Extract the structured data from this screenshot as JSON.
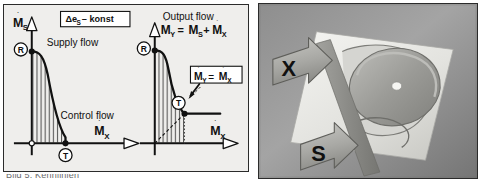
{
  "figure": {
    "background_color": "#ffffff",
    "panel_background": "#efeeec",
    "border_color": "#2b2b2b",
    "curve_color": "#111111",
    "hatch_color": "#333333"
  },
  "caption": {
    "text": "Bild 5. Kennlinien"
  },
  "diagram": {
    "condition_box": {
      "label": "Δe",
      "subscript": "S",
      "suffix": "– konst"
    },
    "left_chart": {
      "y_axis_label": {
        "symbol": "M",
        "dot": "̇",
        "subscript": "S"
      },
      "x_axis_label": {
        "symbol": "M",
        "dot": "̇",
        "subscript": "X"
      },
      "curve_title": "Supply flow",
      "axis_title": "Control flow",
      "markers": [
        {
          "id": "R",
          "label": "R",
          "position": "curve-start-top-left"
        },
        {
          "id": "T",
          "label": "T",
          "position": "curve-end-bottom-right"
        }
      ],
      "fill_style": "vertical-hatch"
    },
    "right_chart": {
      "y_axis_label": {
        "symbol": "M",
        "dot": "̇",
        "subscript": "Y"
      },
      "x_axis_label": {
        "symbol": "M",
        "dot": "̇",
        "subscript": "X"
      },
      "curve_title": "Output flow",
      "equation": {
        "lhs_symbol": "M",
        "lhs_subscript": "Y",
        "equals": "=",
        "term1_symbol": "M",
        "term1_subscript": "S",
        "plus": "+",
        "term2_symbol": "M",
        "term2_subscript": "X"
      },
      "callout_box": {
        "lhs_symbol": "M",
        "lhs_subscript": "Y",
        "equals": "=",
        "rhs_symbol": "M",
        "rhs_subscript": "X"
      },
      "markers": [
        {
          "id": "R",
          "label": "R",
          "position": "curve-start-top-left"
        },
        {
          "id": "T",
          "label": "T",
          "position": "curve-knee"
        }
      ],
      "fill_style": "vertical-hatch",
      "guide_lines": [
        "diagonal-dashed-from-origin",
        "vertical-dotted-drop"
      ]
    }
  },
  "photo": {
    "label_x": "X",
    "label_s": "S",
    "description": "grayscale photograph of a valve plate with two arrow callouts"
  }
}
